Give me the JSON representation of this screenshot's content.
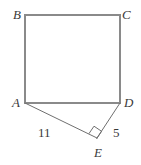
{
  "figure": {
    "kind": "geometry-diagram",
    "background_color": "#ffffff",
    "outline_color": "#8a8a8a",
    "thin_line_color": "#6f6f6f",
    "label_color": "#3a3a3a",
    "vertices": [
      {
        "id": "B",
        "label": "B",
        "x": 25,
        "y": 15
      },
      {
        "id": "C",
        "label": "C",
        "x": 120,
        "y": 15
      },
      {
        "id": "A",
        "label": "A",
        "x": 25,
        "y": 103
      },
      {
        "id": "D",
        "label": "D",
        "x": 120,
        "y": 103
      },
      {
        "id": "E",
        "label": "E",
        "x": 97,
        "y": 138
      }
    ],
    "edges": [
      {
        "id": "BC",
        "from": "B",
        "to": "C",
        "style": "thick"
      },
      {
        "id": "AB",
        "from": "A",
        "to": "B",
        "style": "thick"
      },
      {
        "id": "CD",
        "from": "C",
        "to": "D",
        "style": "thick"
      },
      {
        "id": "AD",
        "from": "A",
        "to": "D",
        "style": "thick"
      },
      {
        "id": "AE",
        "from": "A",
        "to": "E",
        "style": "thin"
      },
      {
        "id": "ED",
        "from": "E",
        "to": "D",
        "style": "thin"
      }
    ],
    "measure_labels": [
      {
        "id": "len-AE",
        "edge": "AE",
        "text": "11"
      },
      {
        "id": "len-ED",
        "edge": "ED",
        "text": "5"
      }
    ],
    "right_angle": {
      "at_vertex": "E",
      "marker": "square",
      "size": 9
    }
  }
}
